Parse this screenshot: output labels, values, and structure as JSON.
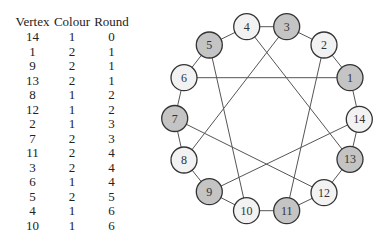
{
  "table": {
    "headers": [
      "Vertex",
      "Colour",
      "Round"
    ],
    "rows": [
      [
        "14",
        "1",
        "0"
      ],
      [
        "1",
        "2",
        "1"
      ],
      [
        "9",
        "2",
        "1"
      ],
      [
        "13",
        "2",
        "1"
      ],
      [
        "8",
        "1",
        "2"
      ],
      [
        "12",
        "1",
        "2"
      ],
      [
        "2",
        "1",
        "3"
      ],
      [
        "7",
        "2",
        "3"
      ],
      [
        "11",
        "2",
        "4"
      ],
      [
        "3",
        "2",
        "4"
      ],
      [
        "6",
        "1",
        "4"
      ],
      [
        "5",
        "2",
        "5"
      ],
      [
        "4",
        "1",
        "6"
      ],
      [
        "10",
        "1",
        "6"
      ]
    ]
  },
  "graph": {
    "colors": {
      "colour1_fill": "#f2f2f2",
      "colour2_fill": "#c4c4c4",
      "stroke": "#333333",
      "edge": "#555555"
    },
    "nodes": [
      {
        "id": "1",
        "x": 350,
        "y": 77.7,
        "colour": 2
      },
      {
        "id": "2",
        "x": 324,
        "y": 45,
        "colour": 1
      },
      {
        "id": "3",
        "x": 286.7,
        "y": 26.7,
        "colour": 2
      },
      {
        "id": "4",
        "x": 246.7,
        "y": 26.7,
        "colour": 1
      },
      {
        "id": "5",
        "x": 209.3,
        "y": 45,
        "colour": 2
      },
      {
        "id": "6",
        "x": 184,
        "y": 77.7,
        "colour": 1
      },
      {
        "id": "7",
        "x": 174.7,
        "y": 118.5,
        "colour": 2
      },
      {
        "id": "8",
        "x": 184,
        "y": 160,
        "colour": 1
      },
      {
        "id": "9",
        "x": 209.3,
        "y": 191.7,
        "colour": 2
      },
      {
        "id": "10",
        "x": 246.5,
        "y": 210.7,
        "colour": 1
      },
      {
        "id": "11",
        "x": 286.7,
        "y": 210.7,
        "colour": 2
      },
      {
        "id": "12",
        "x": 324,
        "y": 192.7,
        "colour": 1
      },
      {
        "id": "13",
        "x": 350,
        "y": 159.3,
        "colour": 2
      },
      {
        "id": "14",
        "x": 359.3,
        "y": 119.3,
        "colour": 1
      }
    ],
    "edges": [
      [
        "4",
        "3"
      ],
      [
        "3",
        "2"
      ],
      [
        "2",
        "1"
      ],
      [
        "1",
        "14"
      ],
      [
        "14",
        "13"
      ],
      [
        "13",
        "12"
      ],
      [
        "12",
        "11"
      ],
      [
        "11",
        "10"
      ],
      [
        "10",
        "9"
      ],
      [
        "9",
        "8"
      ],
      [
        "8",
        "7"
      ],
      [
        "7",
        "6"
      ],
      [
        "6",
        "5"
      ],
      [
        "5",
        "4"
      ],
      [
        "6",
        "1"
      ],
      [
        "4",
        "13"
      ],
      [
        "3",
        "8"
      ],
      [
        "5",
        "10"
      ],
      [
        "2",
        "11"
      ],
      [
        "7",
        "12"
      ],
      [
        "14",
        "9"
      ]
    ]
  }
}
